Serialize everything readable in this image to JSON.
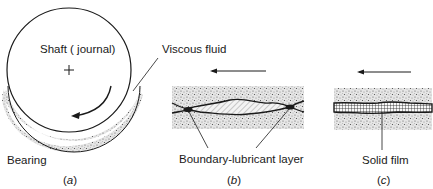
{
  "figure": {
    "panels": [
      {
        "id": "a",
        "caption_open": "(",
        "caption_letter": "a",
        "caption_close": ")",
        "labels": {
          "shaft": "Shaft ( journal)",
          "bearing": "Bearing",
          "fluid": "Viscous fluid"
        },
        "icons": [
          "center-cross-icon",
          "rotation-arrow-icon"
        ]
      },
      {
        "id": "b",
        "caption_open": "(",
        "caption_letter": "b",
        "caption_close": ")",
        "labels": {
          "layer": "Boundary-lubricant layer"
        },
        "icons": [
          "motion-arrow-left-icon"
        ]
      },
      {
        "id": "c",
        "caption_open": "(",
        "caption_letter": "c",
        "caption_close": ")",
        "labels": {
          "film": "Solid film"
        },
        "icons": [
          "motion-arrow-left-icon"
        ]
      }
    ],
    "colors": {
      "ink": "#1a1a1a",
      "stipple": "#8a8a8a",
      "background": "#ffffff"
    }
  }
}
